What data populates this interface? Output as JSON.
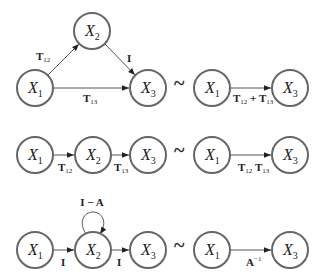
{
  "diagram": {
    "relation_symbol": "~",
    "rows": [
      {
        "left": {
          "nodes": [
            {
              "id": "X1",
              "base": "X",
              "sub": "1"
            },
            {
              "id": "X2",
              "base": "X",
              "sub": "2"
            },
            {
              "id": "X3",
              "base": "X",
              "sub": "3"
            }
          ],
          "edges": [
            {
              "from": "X1",
              "to": "X2",
              "label": "T",
              "sub": "12"
            },
            {
              "from": "X2",
              "to": "X3",
              "label": "I",
              "sub": ""
            },
            {
              "from": "X1",
              "to": "X3",
              "label": "T",
              "sub": "13"
            }
          ]
        },
        "right": {
          "nodes": [
            {
              "id": "X1",
              "base": "X",
              "sub": "1"
            },
            {
              "id": "X3",
              "base": "X",
              "sub": "3"
            }
          ],
          "edge": {
            "from": "X1",
            "to": "X3",
            "label_a": "T",
            "sub_a": "12",
            "op": " + ",
            "label_b": "T",
            "sub_b": "13"
          }
        }
      },
      {
        "left": {
          "nodes": [
            {
              "id": "X1",
              "base": "X",
              "sub": "1"
            },
            {
              "id": "X2",
              "base": "X",
              "sub": "2"
            },
            {
              "id": "X3",
              "base": "X",
              "sub": "3"
            }
          ],
          "edges": [
            {
              "from": "X1",
              "to": "X2",
              "label": "T",
              "sub": "12"
            },
            {
              "from": "X2",
              "to": "X3",
              "label": "T",
              "sub": "13"
            }
          ]
        },
        "right": {
          "nodes": [
            {
              "id": "X1",
              "base": "X",
              "sub": "1"
            },
            {
              "id": "X3",
              "base": "X",
              "sub": "3"
            }
          ],
          "edge": {
            "from": "X1",
            "to": "X3",
            "label_a": "T",
            "sub_a": "12",
            "op": " ",
            "label_b": "T",
            "sub_b": "13"
          }
        }
      },
      {
        "left": {
          "nodes": [
            {
              "id": "X1",
              "base": "X",
              "sub": "1"
            },
            {
              "id": "X2",
              "base": "X",
              "sub": "2"
            },
            {
              "id": "X3",
              "base": "X",
              "sub": "3"
            }
          ],
          "edges": [
            {
              "from": "X1",
              "to": "X2",
              "label": "I",
              "sub": ""
            },
            {
              "from": "X2",
              "to": "X3",
              "label": "I",
              "sub": ""
            },
            {
              "from": "X2",
              "to": "X2",
              "label": "I − A",
              "sub": "",
              "self_loop": true
            }
          ]
        },
        "right": {
          "nodes": [
            {
              "id": "X1",
              "base": "X",
              "sub": "1"
            },
            {
              "id": "X3",
              "base": "X",
              "sub": "3"
            }
          ],
          "edge": {
            "from": "X1",
            "to": "X3",
            "label": "A",
            "sup": "−1"
          }
        }
      }
    ]
  }
}
